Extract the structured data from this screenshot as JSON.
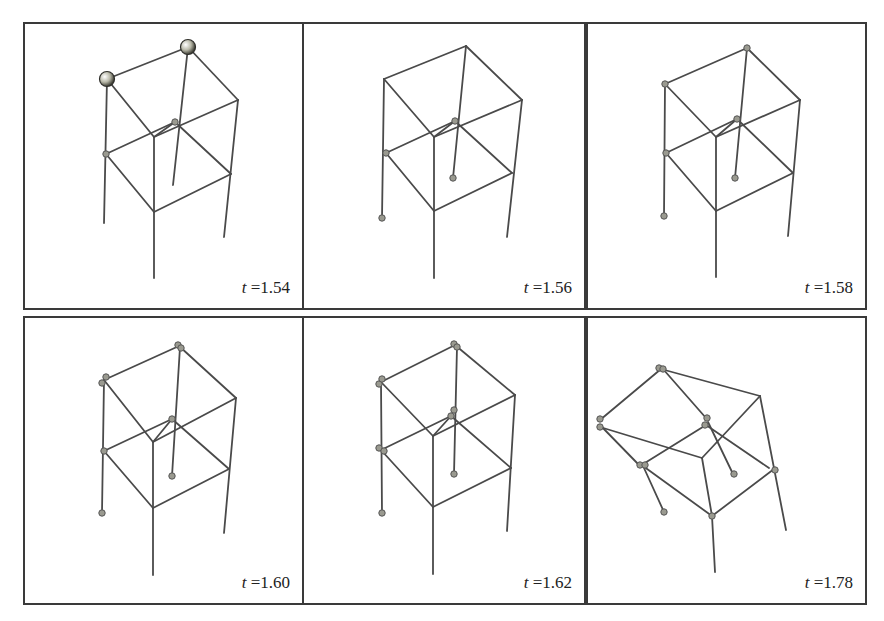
{
  "figure": {
    "background": "#ffffff",
    "line_color": "#4a4a4a",
    "border_color": "#3a3a3a",
    "panels": [
      {
        "id": "p1",
        "time_var": "t",
        "time_value": "=1.54",
        "box": [
          23,
          22,
          281,
          288
        ],
        "lines": [
          [
            [
              107,
              79
            ],
            [
              188,
              47
            ]
          ],
          [
            [
              188,
              47
            ],
            [
              238,
              100
            ]
          ],
          [
            [
              107,
              79
            ],
            [
              154,
              137
            ]
          ],
          [
            [
              154,
              137
            ],
            [
              238,
              100
            ]
          ],
          [
            [
              107,
              79
            ],
            [
              104,
              223
            ]
          ],
          [
            [
              188,
              47
            ],
            [
              173,
              185
            ]
          ],
          [
            [
              238,
              100
            ],
            [
              224,
              237
            ]
          ],
          [
            [
              154,
              137
            ],
            [
              154,
              278
            ]
          ],
          [
            [
              106,
              154
            ],
            [
              175,
              122
            ]
          ],
          [
            [
              175,
              122
            ],
            [
              231,
              174
            ]
          ],
          [
            [
              106,
              154
            ],
            [
              154,
              212
            ]
          ],
          [
            [
              154,
              212
            ],
            [
              231,
              174
            ]
          ],
          [
            [
              154,
              137
            ],
            [
              175,
              122
            ]
          ]
        ],
        "big_nodes": [
          [
            107,
            79
          ],
          [
            188,
            47
          ]
        ],
        "small_nodes": [
          [
            106,
            154
          ],
          [
            175,
            122
          ]
        ]
      },
      {
        "id": "p2",
        "time_var": "t",
        "time_value": "=1.56",
        "box": [
          302,
          22,
          284,
          288
        ],
        "lines": [
          [
            [
              384,
              79
            ],
            [
              466,
              46
            ]
          ],
          [
            [
              466,
              46
            ],
            [
              522,
              100
            ]
          ],
          [
            [
              384,
              79
            ],
            [
              434,
              137
            ]
          ],
          [
            [
              434,
              137
            ],
            [
              522,
              100
            ]
          ],
          [
            [
              384,
              79
            ],
            [
              382,
              218
            ]
          ],
          [
            [
              466,
              46
            ],
            [
              453,
              178
            ]
          ],
          [
            [
              522,
              100
            ],
            [
              507,
              237
            ]
          ],
          [
            [
              434,
              137
            ],
            [
              434,
              278
            ]
          ],
          [
            [
              386,
              153
            ],
            [
              455,
              121
            ]
          ],
          [
            [
              455,
              121
            ],
            [
              512,
              173
            ]
          ],
          [
            [
              386,
              153
            ],
            [
              434,
              211
            ]
          ],
          [
            [
              434,
              211
            ],
            [
              512,
              173
            ]
          ],
          [
            [
              434,
              137
            ],
            [
              455,
              121
            ]
          ]
        ],
        "big_nodes": [],
        "small_nodes": [
          [
            386,
            153
          ],
          [
            455,
            121
          ],
          [
            453,
            178
          ],
          [
            382,
            218
          ]
        ]
      },
      {
        "id": "p3",
        "time_var": "t",
        "time_value": "=1.58",
        "box": [
          586,
          22,
          281,
          288
        ],
        "lines": [
          [
            [
              665,
              84
            ],
            [
              747,
              48
            ]
          ],
          [
            [
              747,
              48
            ],
            [
              800,
              100
            ]
          ],
          [
            [
              665,
              84
            ],
            [
              716,
              137
            ]
          ],
          [
            [
              716,
              137
            ],
            [
              800,
              100
            ]
          ],
          [
            [
              665,
              84
            ],
            [
              664,
              216
            ]
          ],
          [
            [
              747,
              48
            ],
            [
              735,
              178
            ]
          ],
          [
            [
              800,
              100
            ],
            [
              788,
              236
            ]
          ],
          [
            [
              716,
              137
            ],
            [
              716,
              277
            ]
          ],
          [
            [
              666,
              153
            ],
            [
              737,
              119
            ]
          ],
          [
            [
              737,
              119
            ],
            [
              793,
              173
            ]
          ],
          [
            [
              666,
              153
            ],
            [
              716,
              211
            ]
          ],
          [
            [
              716,
              211
            ],
            [
              793,
              173
            ]
          ],
          [
            [
              716,
              137
            ],
            [
              737,
              119
            ]
          ]
        ],
        "big_nodes": [],
        "small_nodes": [
          [
            665,
            84
          ],
          [
            747,
            48
          ],
          [
            666,
            153
          ],
          [
            737,
            119
          ],
          [
            735,
            178
          ],
          [
            664,
            216
          ]
        ]
      },
      {
        "id": "p4",
        "time_var": "t",
        "time_value": "=1.60",
        "box": [
          23,
          316,
          281,
          289
        ],
        "lines": [
          [
            [
              104,
              380
            ],
            [
              179,
              346
            ]
          ],
          [
            [
              179,
              346
            ],
            [
              236,
              398
            ]
          ],
          [
            [
              104,
              380
            ],
            [
              153,
              442
            ]
          ],
          [
            [
              153,
              442
            ],
            [
              236,
              398
            ]
          ],
          [
            [
              104,
              380
            ],
            [
              102,
              513
            ]
          ],
          [
            [
              180,
              347
            ],
            [
              172,
              476
            ]
          ],
          [
            [
              236,
              398
            ],
            [
              224,
              533
            ]
          ],
          [
            [
              153,
              442
            ],
            [
              153,
              575
            ]
          ],
          [
            [
              104,
              451
            ],
            [
              172,
              419
            ]
          ],
          [
            [
              172,
              419
            ],
            [
              229,
              469
            ]
          ],
          [
            [
              104,
              451
            ],
            [
              153,
              508
            ]
          ],
          [
            [
              153,
              508
            ],
            [
              229,
              469
            ]
          ],
          [
            [
              153,
              442
            ],
            [
              172,
              419
            ]
          ]
        ],
        "big_nodes": [],
        "small_nodes": [
          [
            102,
            383
          ],
          [
            106,
            377
          ],
          [
            178,
            345
          ],
          [
            181,
            348
          ],
          [
            104,
            451
          ],
          [
            172,
            419
          ],
          [
            172,
            476
          ],
          [
            102,
            513
          ]
        ]
      },
      {
        "id": "p5",
        "time_var": "t",
        "time_value": "=1.62",
        "box": [
          302,
          316,
          284,
          289
        ],
        "lines": [
          [
            [
              381,
              382
            ],
            [
              455,
              345
            ]
          ],
          [
            [
              455,
              345
            ],
            [
              515,
              395
            ]
          ],
          [
            [
              381,
              382
            ],
            [
              433,
              436
            ]
          ],
          [
            [
              433,
              436
            ],
            [
              515,
              395
            ]
          ],
          [
            [
              381,
              382
            ],
            [
              382,
              513
            ]
          ],
          [
            [
              457,
              347
            ],
            [
              454,
              474
            ]
          ],
          [
            [
              515,
              395
            ],
            [
              507,
              531
            ]
          ],
          [
            [
              433,
              436
            ],
            [
              433,
              574
            ]
          ],
          [
            [
              381,
              450
            ],
            [
              451,
              416
            ]
          ],
          [
            [
              451,
              416
            ],
            [
              511,
              468
            ]
          ],
          [
            [
              381,
              450
            ],
            [
              433,
              507
            ]
          ],
          [
            [
              433,
              507
            ],
            [
              511,
              468
            ]
          ],
          [
            [
              433,
              436
            ],
            [
              451,
              416
            ]
          ]
        ],
        "big_nodes": [],
        "small_nodes": [
          [
            379,
            384
          ],
          [
            382,
            379
          ],
          [
            454,
            344
          ],
          [
            457,
            347
          ],
          [
            379,
            448
          ],
          [
            384,
            451
          ],
          [
            454,
            410
          ],
          [
            451,
            416
          ],
          [
            454,
            474
          ],
          [
            382,
            513
          ]
        ]
      },
      {
        "id": "p6",
        "time_var": "t",
        "time_value": "=1.78",
        "box": [
          586,
          316,
          281,
          289
        ],
        "lines": [
          [
            [
              661,
              369
            ],
            [
              760,
              396
            ]
          ],
          [
            [
              600,
              420
            ],
            [
              661,
              369
            ]
          ],
          [
            [
              600,
              427
            ],
            [
              702,
              458
            ]
          ],
          [
            [
              760,
              396
            ],
            [
              702,
              458
            ]
          ],
          [
            [
              663,
              369
            ],
            [
              706,
              418
            ]
          ],
          [
            [
              600,
              425
            ],
            [
              640,
              466
            ]
          ],
          [
            [
              640,
              466
            ],
            [
              706,
              425
            ]
          ],
          [
            [
              706,
              425
            ],
            [
              769,
              468
            ]
          ],
          [
            [
              643,
              466
            ],
            [
              712,
              516
            ]
          ],
          [
            [
              712,
              516
            ],
            [
              774,
              469
            ]
          ],
          [
            [
              702,
              458
            ],
            [
              712,
              516
            ]
          ],
          [
            [
              760,
              396
            ],
            [
              786,
              530
            ]
          ],
          [
            [
              708,
              422
            ],
            [
              733,
              474
            ]
          ],
          [
            [
              644,
              468
            ],
            [
              664,
              512
            ]
          ],
          [
            [
              712,
              516
            ],
            [
              715,
              572
            ]
          ]
        ],
        "big_nodes": [],
        "small_nodes": [
          [
            659,
            368
          ],
          [
            663,
            369
          ],
          [
            600,
            419
          ],
          [
            600,
            427
          ],
          [
            707,
            418
          ],
          [
            705,
            425
          ],
          [
            640,
            465
          ],
          [
            645,
            465
          ],
          [
            775,
            470
          ],
          [
            734,
            474
          ],
          [
            664,
            512
          ],
          [
            712,
            516
          ]
        ]
      }
    ]
  }
}
